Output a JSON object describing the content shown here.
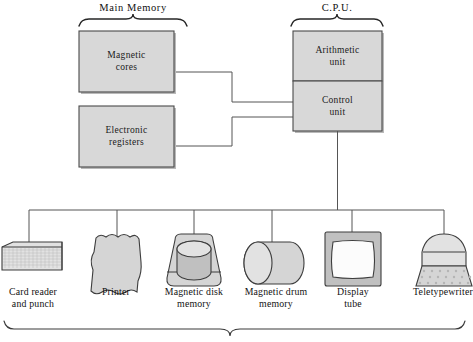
{
  "figure": {
    "title_groups": {
      "main_memory": "Main Memory",
      "cpu": "C.P.U."
    },
    "memory_units": [
      {
        "id": "magnetic-cores",
        "line1": "Magnetic",
        "line2": "cores"
      },
      {
        "id": "electronic-registers",
        "line1": "Electronic",
        "line2": "registers"
      }
    ],
    "cpu_units": [
      {
        "id": "arithmetic-unit",
        "line1": "Arithmetic",
        "line2": "unit"
      },
      {
        "id": "control-unit",
        "line1": "Control",
        "line2": "unit"
      }
    ],
    "peripherals": [
      {
        "id": "card-reader-and-punch",
        "icon": "punch-card-reader-icon",
        "line1": "Card reader",
        "line2": "and punch"
      },
      {
        "id": "printer",
        "icon": "printer-paper-icon",
        "line1": "Printer",
        "line2": ""
      },
      {
        "id": "magnetic-disk-memory",
        "icon": "disk-drive-icon",
        "line1": "Magnetic disk",
        "line2": "memory"
      },
      {
        "id": "magnetic-drum-memory",
        "icon": "drum-cylinder-icon",
        "line1": "Magnetic drum",
        "line2": "memory"
      },
      {
        "id": "display-tube",
        "icon": "crt-display-icon",
        "line1": "Display",
        "line2": "tube"
      },
      {
        "id": "teletypewriter",
        "icon": "teletypewriter-icon",
        "line1": "Teletypewriter",
        "line2": ""
      }
    ],
    "colors": {
      "box_fill": "#d8d8d8",
      "box_stroke": "#4a4a4a",
      "line": "#555555",
      "text": "#111111",
      "background": "#ffffff"
    }
  }
}
